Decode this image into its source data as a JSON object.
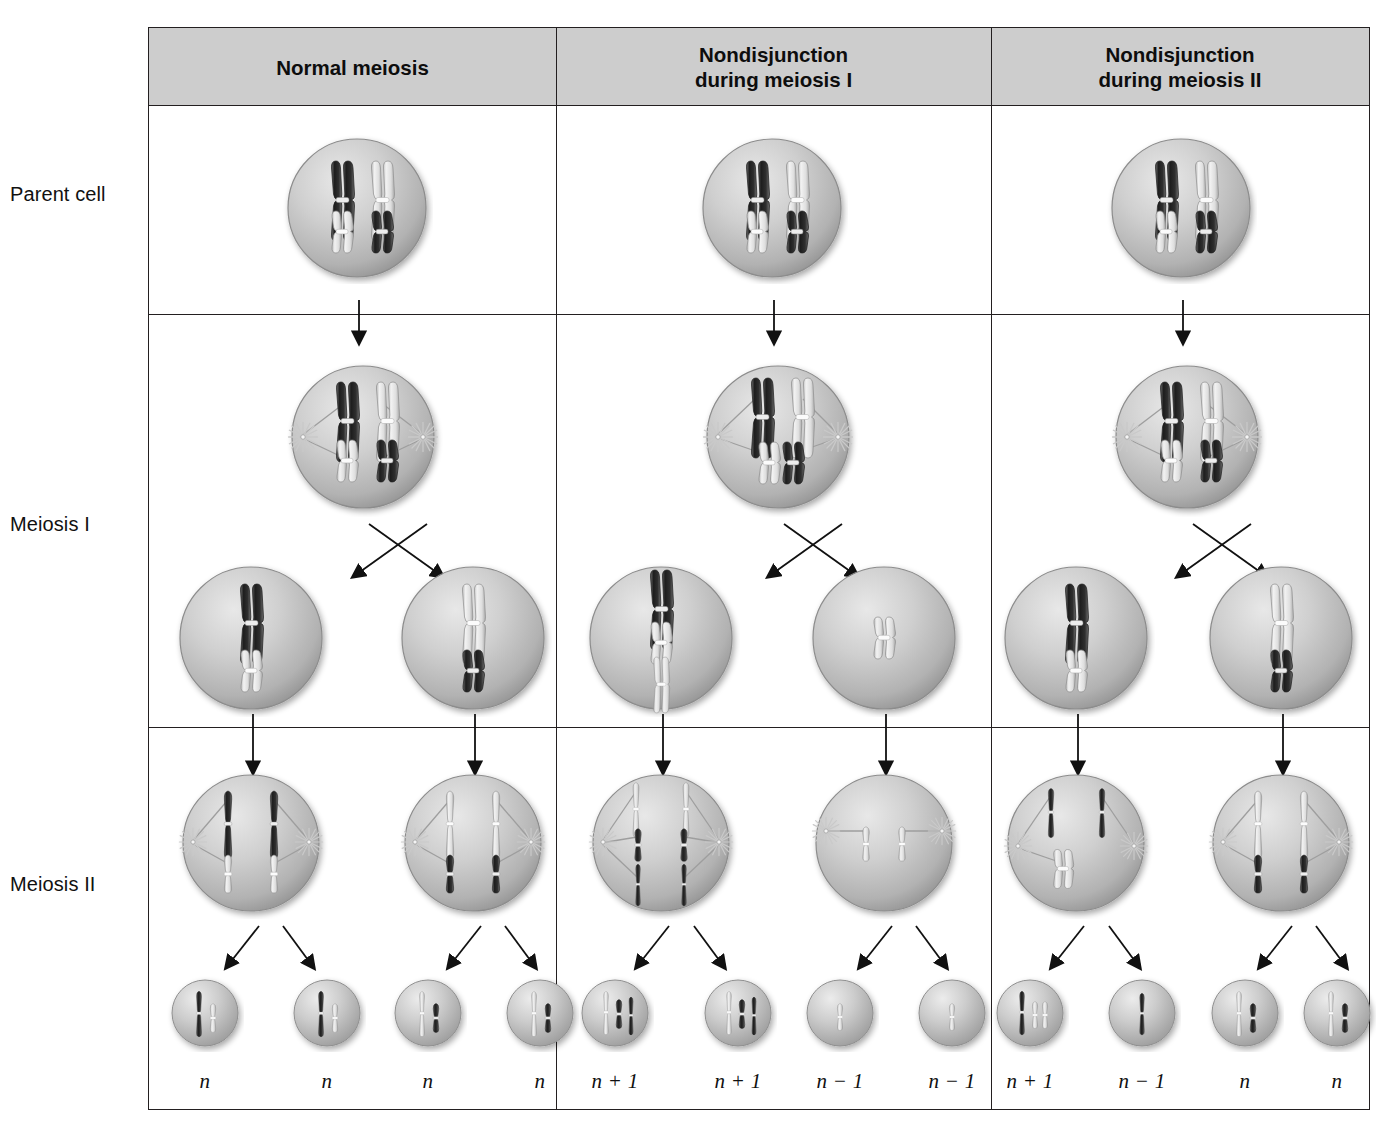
{
  "figure": {
    "frame_color": "#231f20",
    "header_fill": "#cdcdcd",
    "cell_fill": "#b9b9b9",
    "chromosome_dark": "#2a2a2a",
    "chromosome_light": "#e4e4e4"
  },
  "columns": [
    {
      "id": "normal",
      "label": "Normal meiosis"
    },
    {
      "id": "nondisjunction-meiosis-1",
      "label": "Nondisjunction\nduring meiosis I",
      "line1": "Nondisjunction",
      "line2": "during meiosis I"
    },
    {
      "id": "nondisjunction-meiosis-2",
      "label": "Nondisjunction\nduring meiosis II",
      "line1": "Nondisjunction",
      "line2": "during meiosis II"
    }
  ],
  "rows": [
    {
      "id": "parent-cell",
      "label": "Parent cell"
    },
    {
      "id": "meiosis-1",
      "label": "Meiosis I"
    },
    {
      "id": "meiosis-2",
      "label": "Meiosis II"
    }
  ],
  "gametes": {
    "normal": [
      "n",
      "n",
      "n",
      "n"
    ],
    "nondisjunction_meiosis_1": [
      "n + 1",
      "n + 1",
      "n − 1",
      "n − 1"
    ],
    "nondisjunction_meiosis_2": [
      "n + 1",
      "n − 1",
      "n",
      "n"
    ]
  },
  "stages": {
    "parent_cell": "Parent cell containing two homologous pairs of replicated chromosomes",
    "metaphase_1": "Meiosis I metaphase with spindle asters and paired homologs",
    "meiosis_1_products": "Two cells produced by meiosis I",
    "anaphase_2": "Meiosis II with sister chromatids moving to opposite poles",
    "gametes": "Four resulting gametes"
  }
}
